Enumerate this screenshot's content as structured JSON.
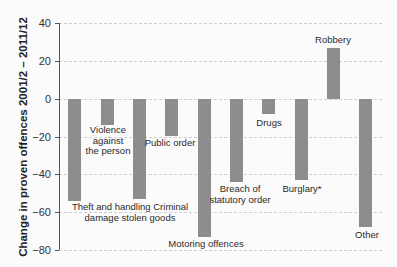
{
  "chart_data": {
    "type": "bar",
    "title": "",
    "xlabel": "",
    "ylabel": "Change in proven offences 2001/2 – 2011/12",
    "ylim": [
      -80,
      40
    ],
    "yticks": [
      40,
      20,
      0,
      -20,
      -40,
      -60,
      -80
    ],
    "ytick_labels": [
      "40",
      "20",
      "0",
      "−20",
      "−40",
      "−60",
      "−80"
    ],
    "grid": true,
    "legend": null,
    "categories": [
      "Theft and handling stolen goods",
      "Violence against the person",
      "Criminal damage",
      "Public order",
      "Motoring offences",
      "Breach of statutory order",
      "Drugs",
      "Burglary*",
      "Robbery",
      "Other"
    ],
    "values": [
      -54,
      -14,
      -53,
      -20,
      -73,
      -44,
      -8,
      -43,
      27,
      -68
    ],
    "bar_labels": [
      "",
      "Violence\nagainst\nthe person",
      "",
      "Public order",
      "Motoring offences",
      "Breach of\nstatutory order",
      "Drugs",
      "Burglary*",
      "Robbery",
      "Other"
    ],
    "combined_label": "Theft and handling Criminal\ndamage stolen goods",
    "bar_color": "#8d8d8d"
  }
}
